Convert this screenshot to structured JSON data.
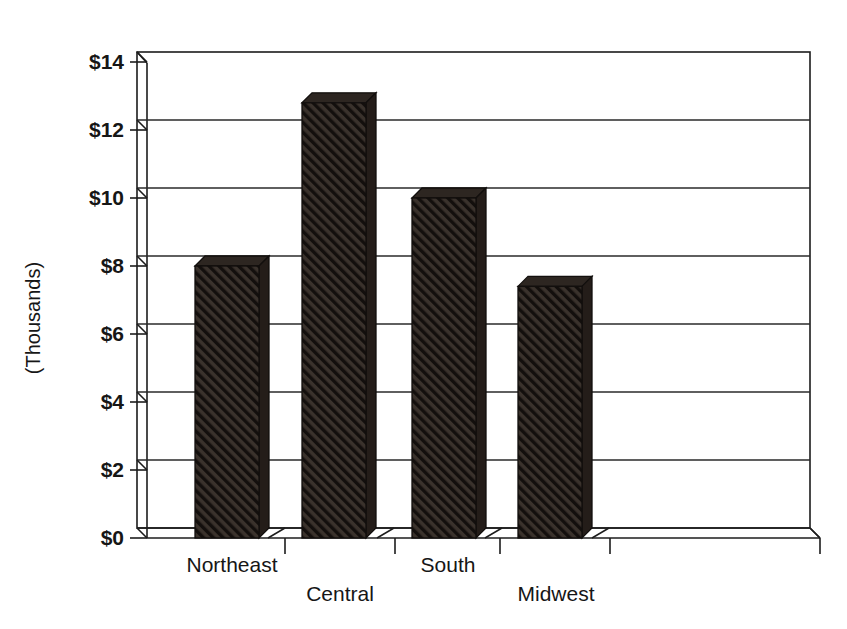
{
  "chart_data": {
    "type": "bar",
    "title": "",
    "subtitle": "",
    "xlabel": "",
    "ylabel": "(Thousands)",
    "categories": [
      "Northeast",
      "Central",
      "South",
      "Midwest"
    ],
    "values": [
      8.0,
      12.8,
      10.0,
      7.4
    ],
    "value_prefix": "$",
    "ylim": [
      0,
      14
    ],
    "ytick_step": 2,
    "ytick_labels": [
      "$0",
      "$2",
      "$4",
      "$6",
      "$8",
      "$10",
      "$12",
      "$14"
    ],
    "ytick_values": [
      0,
      2,
      4,
      6,
      8,
      10,
      12,
      14
    ],
    "grid": true,
    "grid_axis": "y",
    "legend": false,
    "legend_position": "none",
    "style": "3d-bar",
    "series": [
      {
        "name": "Sales",
        "values": [
          8.0,
          12.8,
          10.0,
          7.4
        ],
        "fill": "diagonal-hatch",
        "color": "#2a2420"
      }
    ]
  },
  "axis": {
    "y_title": "(Thousands)",
    "ticks": [
      "$14",
      "$12",
      "$10",
      "$8",
      "$6",
      "$4",
      "$2",
      "$0"
    ]
  },
  "categories": {
    "row_upper": [
      "Northeast",
      "South"
    ],
    "row_lower": [
      "Central",
      "Midwest"
    ],
    "all": [
      "Northeast",
      "Central",
      "South",
      "Midwest"
    ]
  },
  "colors": {
    "bar_front": "#2a2420",
    "bar_side": "#241d19",
    "bar_top": "#2d2621",
    "ink": "#1a1a1a",
    "background": "#ffffff"
  }
}
